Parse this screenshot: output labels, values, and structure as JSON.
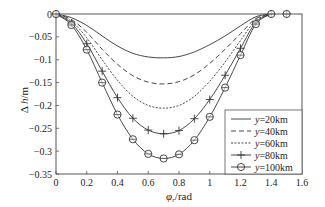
{
  "chart_data": {
    "type": "line",
    "title": "",
    "xlabel": "φ_r /rad",
    "ylabel": "Δ h/m",
    "xlim": [
      0,
      1.6
    ],
    "ylim": [
      -0.35,
      0
    ],
    "xticks": [
      0,
      0.2,
      0.4,
      0.6,
      0.8,
      1,
      1.2,
      1.4,
      1.6
    ],
    "xtick_labels": [
      "0",
      "0.2",
      "0.4",
      "0.6",
      "0.8",
      "1",
      "1.2",
      "1.4",
      "1.6"
    ],
    "yticks": [
      0,
      -0.05,
      -0.1,
      -0.15,
      -0.2,
      -0.25,
      -0.3,
      -0.35
    ],
    "ytick_labels": [
      "0",
      "-0.05",
      "-0.1",
      "-0.15",
      "-0.2",
      "-0.25",
      "-0.3",
      "-0.35"
    ],
    "grid": false,
    "legend_position": "lower right",
    "x": [
      0,
      0.1,
      0.2,
      0.3,
      0.4,
      0.5,
      0.6,
      0.7,
      0.8,
      0.9,
      1.0,
      1.1,
      1.2,
      1.3,
      1.4,
      1.5
    ],
    "series": [
      {
        "name": "y=20km",
        "style": "solid",
        "marker": "none",
        "values": [
          0,
          -0.008,
          -0.025,
          -0.048,
          -0.07,
          -0.086,
          -0.094,
          -0.096,
          -0.093,
          -0.083,
          -0.067,
          -0.048,
          -0.026,
          -0.006,
          0,
          0
        ]
      },
      {
        "name": "y=40km",
        "style": "dashed",
        "marker": "none",
        "values": [
          0,
          -0.012,
          -0.04,
          -0.077,
          -0.11,
          -0.135,
          -0.149,
          -0.153,
          -0.148,
          -0.133,
          -0.108,
          -0.077,
          -0.043,
          -0.01,
          0,
          0
        ]
      },
      {
        "name": "y=60km",
        "style": "dotted",
        "marker": "none",
        "values": [
          0,
          -0.016,
          -0.052,
          -0.1,
          -0.145,
          -0.18,
          -0.2,
          -0.206,
          -0.2,
          -0.18,
          -0.147,
          -0.105,
          -0.058,
          -0.014,
          0,
          0
        ]
      },
      {
        "name": "y=80km",
        "style": "solid",
        "marker": "plus",
        "values": [
          0,
          -0.02,
          -0.065,
          -0.125,
          -0.183,
          -0.228,
          -0.254,
          -0.262,
          -0.255,
          -0.229,
          -0.187,
          -0.134,
          -0.075,
          -0.018,
          0,
          0
        ]
      },
      {
        "name": "y=100km",
        "style": "solid",
        "marker": "circle",
        "values": [
          0,
          -0.024,
          -0.078,
          -0.15,
          -0.22,
          -0.274,
          -0.306,
          -0.316,
          -0.307,
          -0.276,
          -0.225,
          -0.161,
          -0.09,
          -0.022,
          0,
          0
        ]
      }
    ]
  },
  "legend": {
    "items": [
      {
        "label": "y=20km"
      },
      {
        "label": "y=40km"
      },
      {
        "label": "y=60km"
      },
      {
        "label": "y=80km"
      },
      {
        "label": "y=100km"
      }
    ]
  },
  "axes": {
    "xlabel_symbol": "φ",
    "xlabel_sub": "r",
    "xlabel_unit": "/rad",
    "ylabel_symbol": "Δ ",
    "ylabel_var": "h",
    "ylabel_unit": "/m"
  }
}
